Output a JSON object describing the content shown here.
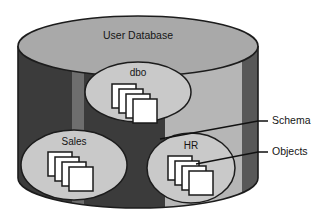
{
  "diagram": {
    "type": "database-schema-cylinder",
    "title": "User Database",
    "schemas": [
      {
        "id": "dbo",
        "label": "dbo",
        "objects": 4
      },
      {
        "id": "sales",
        "label": "Sales",
        "objects": 4
      },
      {
        "id": "hr",
        "label": "HR",
        "objects": 4
      }
    ],
    "callouts": [
      {
        "id": "schema",
        "label": "Schema"
      },
      {
        "id": "objects",
        "label": "Objects"
      }
    ],
    "colors": {
      "cylinder_top": "#a9a9a9",
      "band_dark": "#3b3b3b",
      "band_mid": "#6f6f6f",
      "band_light": "#b4b4b4",
      "band_light2": "#bdbdbd",
      "band_edge": "#5a5a5a",
      "ellipse_fill": "#c9c9c9",
      "object_fill": "#ffffff",
      "object_stroke": "#1a1a1a",
      "outline": "#1c1c1c",
      "text": "#151515",
      "background": "#ffffff"
    }
  }
}
